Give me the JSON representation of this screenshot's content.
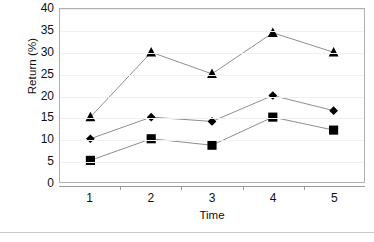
{
  "chart_data": {
    "type": "line",
    "title": "",
    "subtitle": "",
    "xlabel": "Time",
    "ylabel": "Return (%)",
    "categories": [
      "1",
      "2",
      "3",
      "4",
      "5"
    ],
    "x": [
      1,
      2,
      3,
      4,
      5
    ],
    "ylim": [
      0,
      40
    ],
    "ytick_values": [
      0,
      5,
      10,
      15,
      20,
      25,
      30,
      35,
      40
    ],
    "ytick_labels": [
      "0",
      "5",
      "10",
      "15",
      "20",
      "25",
      "30",
      "35",
      "40"
    ],
    "xtick_labels": [
      "1",
      "2",
      "3",
      "4",
      "5"
    ],
    "grid": "horizontal",
    "legend": "none",
    "series": [
      {
        "name": "series-triangle",
        "marker": "triangle",
        "color": "#000000",
        "line_color": "#808080",
        "values": [
          15,
          30,
          25,
          34.5,
          30
        ]
      },
      {
        "name": "series-diamond",
        "marker": "diamond",
        "color": "#000000",
        "line_color": "#808080",
        "values": [
          10,
          15,
          14,
          20,
          16.5
        ]
      },
      {
        "name": "series-square",
        "marker": "square",
        "color": "#000000",
        "line_color": "#808080",
        "values": [
          5,
          10,
          8.5,
          15,
          12
        ]
      }
    ],
    "annotations": []
  },
  "colors": {
    "marker": "#000000",
    "line": "#808080",
    "grid": "#f0f0f0",
    "frame": "#b0b0b0",
    "axis": "#9a9a9a",
    "text": "#111111",
    "background": "#ffffff",
    "rule": "#c8c8c8"
  }
}
